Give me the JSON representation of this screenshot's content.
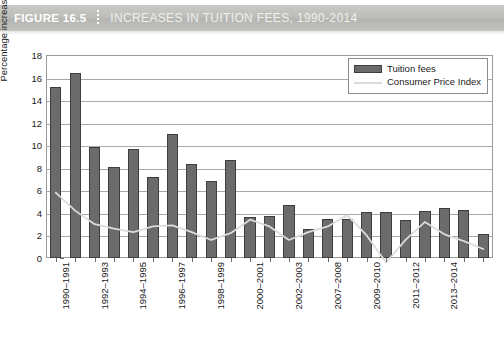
{
  "header": {
    "figure_number": "FIGURE 16.5",
    "title": "INCREASES IN TUITION FEES, 1990-2014"
  },
  "chart_data": {
    "type": "bar",
    "title": "INCREASES IN TUITION FEES, 1990-2014",
    "xlabel": "",
    "ylabel": "Percentage increase",
    "ylim": [
      0,
      18
    ],
    "ytick_step": 2,
    "yticks": [
      0,
      2,
      4,
      6,
      8,
      10,
      12,
      14,
      16,
      18
    ],
    "grid": true,
    "legend_position": "top-right",
    "categories": [
      "1990-1991",
      "1991-1992",
      "1992-1993",
      "1993-1994",
      "1994-1995",
      "1995-1996",
      "1996-1997",
      "1997-1998",
      "1998-1999",
      "1999-2000",
      "2000-2001",
      "2001-2002",
      "2002-2003",
      "2003-2004",
      "2007-2008",
      "2008-2009",
      "2009-2010",
      "2010-2011",
      "2011-2012",
      "2012-2013",
      "2013-2014",
      "2014-2015",
      "2015-2016"
    ],
    "visible_tick_labels": [
      "1990-1991",
      "1992-1993",
      "1994-1995",
      "1996-1997",
      "1998-1999",
      "2000-2001",
      "2002-2003",
      "2007-2008",
      "2009-2010",
      "2011-2012",
      "2013-2014"
    ],
    "series": [
      {
        "name": "Tuition fees",
        "type": "bar",
        "color": "#6b6b6b",
        "values": [
          15.2,
          16.4,
          9.8,
          8.1,
          9.7,
          7.2,
          11.0,
          8.3,
          6.8,
          8.7,
          3.6,
          3.7,
          4.7,
          2.6,
          3.5,
          3.5,
          4.1,
          4.1,
          3.4,
          4.2,
          4.4,
          4.3,
          2.1
        ]
      },
      {
        "name": "Consumer Price Index",
        "type": "line",
        "color": "#dcdcdc",
        "values": [
          5.8,
          4.2,
          3.0,
          2.6,
          2.3,
          2.8,
          2.9,
          2.3,
          1.6,
          2.2,
          3.4,
          2.8,
          1.6,
          2.3,
          2.8,
          3.8,
          2.0,
          -0.4,
          1.6,
          3.2,
          2.1,
          1.5,
          0.8
        ]
      }
    ],
    "legend": [
      {
        "label": "Tuition fees",
        "swatch": "bar"
      },
      {
        "label": "Consumer Price Index",
        "swatch": "line"
      }
    ]
  }
}
